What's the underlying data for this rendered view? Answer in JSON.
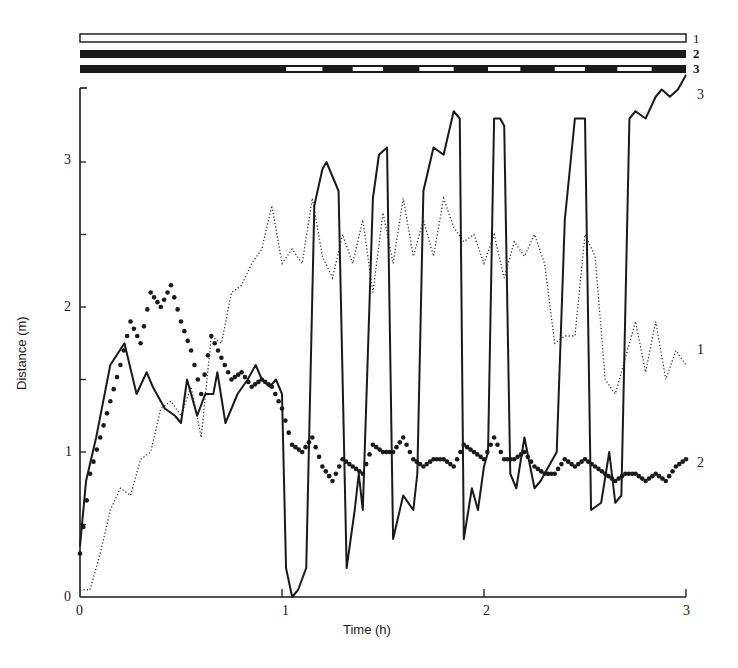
{
  "chart_data": {
    "type": "line",
    "title": "",
    "xlabel": "Time (h)",
    "ylabel": "Distance (m)",
    "xlim": [
      0,
      3
    ],
    "ylim": [
      0,
      3.5
    ],
    "x_ticks": [
      "0",
      "1",
      "2",
      "3"
    ],
    "y_ticks": [
      "0",
      "1",
      "2",
      "3"
    ],
    "grid": false,
    "legend_position": "inline labels at right end of each series",
    "condition_bars": [
      {
        "label": "1",
        "style": "open (white) bar for full duration"
      },
      {
        "label": "2",
        "style": "solid (black) bar for full duration"
      },
      {
        "label": "3",
        "style": "black bar, alternating with white gaps after ~1 h",
        "white_segments_h": [
          [
            1.02,
            1.2
          ],
          [
            1.35,
            1.5
          ],
          [
            1.68,
            1.85
          ],
          [
            2.02,
            2.18
          ],
          [
            2.35,
            2.5
          ],
          [
            2.66,
            2.83
          ]
        ]
      }
    ],
    "series": [
      {
        "name": "1",
        "style": "dotted line",
        "x": [
          0,
          0.05,
          0.1,
          0.15,
          0.2,
          0.25,
          0.3,
          0.35,
          0.4,
          0.45,
          0.5,
          0.55,
          0.6,
          0.65,
          0.7,
          0.75,
          0.8,
          0.85,
          0.9,
          0.95,
          1.0,
          1.05,
          1.1,
          1.15,
          1.2,
          1.25,
          1.3,
          1.35,
          1.4,
          1.45,
          1.5,
          1.55,
          1.6,
          1.65,
          1.7,
          1.75,
          1.8,
          1.85,
          1.9,
          1.95,
          2.0,
          2.05,
          2.1,
          2.15,
          2.2,
          2.25,
          2.3,
          2.35,
          2.4,
          2.45,
          2.5,
          2.55,
          2.6,
          2.65,
          2.7,
          2.75,
          2.8,
          2.85,
          2.9,
          2.95,
          3.0
        ],
        "y": [
          0.05,
          0.05,
          0.3,
          0.6,
          0.75,
          0.7,
          0.95,
          1.0,
          1.3,
          1.35,
          1.25,
          1.45,
          1.1,
          1.8,
          1.75,
          2.1,
          2.15,
          2.3,
          2.4,
          2.7,
          2.3,
          2.4,
          2.3,
          2.75,
          2.35,
          2.2,
          2.5,
          2.3,
          2.6,
          2.1,
          2.65,
          2.3,
          2.75,
          2.35,
          2.6,
          2.35,
          2.75,
          2.55,
          2.45,
          2.5,
          2.3,
          2.5,
          2.2,
          2.45,
          2.35,
          2.5,
          2.3,
          1.75,
          1.8,
          1.8,
          2.5,
          2.35,
          1.5,
          1.4,
          1.65,
          1.9,
          1.55,
          1.9,
          1.5,
          1.7,
          1.6
        ]
      },
      {
        "name": "2",
        "style": "large dots",
        "x": [
          0,
          0.05,
          0.1,
          0.15,
          0.2,
          0.25,
          0.3,
          0.35,
          0.4,
          0.45,
          0.5,
          0.55,
          0.6,
          0.65,
          0.7,
          0.75,
          0.8,
          0.85,
          0.9,
          0.95,
          1.0,
          1.05,
          1.1,
          1.15,
          1.2,
          1.25,
          1.3,
          1.35,
          1.4,
          1.45,
          1.5,
          1.55,
          1.6,
          1.65,
          1.7,
          1.75,
          1.8,
          1.85,
          1.9,
          1.95,
          2.0,
          2.05,
          2.1,
          2.15,
          2.2,
          2.25,
          2.3,
          2.35,
          2.4,
          2.45,
          2.5,
          2.55,
          2.6,
          2.65,
          2.7,
          2.75,
          2.8,
          2.85,
          2.9,
          2.95,
          3.0
        ],
        "y": [
          0.3,
          0.85,
          1.1,
          1.35,
          1.6,
          1.9,
          1.75,
          2.1,
          2.0,
          2.15,
          1.9,
          1.7,
          1.4,
          1.8,
          1.65,
          1.5,
          1.55,
          1.45,
          1.5,
          1.45,
          1.3,
          1.05,
          1.0,
          1.1,
          0.9,
          0.8,
          0.95,
          0.9,
          0.85,
          1.05,
          1.0,
          1.0,
          1.1,
          0.95,
          0.9,
          0.95,
          0.95,
          0.9,
          1.05,
          1.0,
          0.95,
          1.1,
          0.95,
          0.95,
          1.0,
          0.9,
          0.85,
          0.85,
          0.95,
          0.9,
          0.95,
          0.9,
          0.85,
          0.8,
          0.85,
          0.85,
          0.8,
          0.85,
          0.8,
          0.9,
          0.95
        ]
      },
      {
        "name": "3",
        "style": "solid line",
        "x": [
          0,
          0.03,
          0.08,
          0.15,
          0.22,
          0.28,
          0.33,
          0.36,
          0.42,
          0.47,
          0.5,
          0.53,
          0.58,
          0.62,
          0.66,
          0.68,
          0.72,
          0.78,
          0.83,
          0.87,
          0.9,
          0.94,
          0.97,
          1.0,
          1.02,
          1.05,
          1.08,
          1.12,
          1.16,
          1.2,
          1.22,
          1.28,
          1.32,
          1.36,
          1.38,
          1.4,
          1.45,
          1.48,
          1.52,
          1.55,
          1.6,
          1.65,
          1.67,
          1.7,
          1.75,
          1.8,
          1.85,
          1.88,
          1.9,
          1.94,
          1.97,
          2.0,
          2.02,
          2.05,
          2.08,
          2.1,
          2.13,
          2.16,
          2.2,
          2.25,
          2.28,
          2.32,
          2.36,
          2.4,
          2.45,
          2.5,
          2.53,
          2.58,
          2.62,
          2.65,
          2.68,
          2.72,
          2.75,
          2.8,
          2.85,
          2.88,
          2.92,
          2.96,
          3.0
        ],
        "y": [
          0.35,
          0.8,
          1.1,
          1.6,
          1.75,
          1.4,
          1.55,
          1.45,
          1.3,
          1.25,
          1.2,
          1.5,
          1.25,
          1.4,
          1.4,
          1.55,
          1.2,
          1.4,
          1.5,
          1.6,
          1.5,
          1.45,
          1.5,
          1.4,
          0.2,
          0.0,
          0.05,
          0.2,
          2.7,
          2.95,
          3.0,
          2.8,
          0.2,
          0.6,
          0.85,
          0.6,
          2.75,
          3.05,
          3.1,
          0.4,
          0.7,
          0.6,
          0.85,
          2.8,
          3.1,
          3.05,
          3.35,
          3.3,
          0.4,
          0.75,
          0.6,
          0.9,
          1.0,
          3.3,
          3.3,
          3.25,
          0.85,
          0.75,
          1.1,
          0.75,
          0.8,
          0.9,
          1.0,
          2.6,
          3.3,
          3.3,
          0.6,
          0.65,
          1.0,
          0.65,
          0.7,
          3.3,
          3.35,
          3.3,
          3.45,
          3.5,
          3.45,
          3.5,
          3.6
        ]
      }
    ],
    "series_end_labels": [
      "1",
      "2",
      "3"
    ]
  },
  "labels": {
    "xlabel": "Time (h)",
    "ylabel": "Distance (m)",
    "bar_labels": [
      "1",
      "2",
      "3"
    ],
    "series_end_labels": {
      "s1": "1",
      "s2": "2",
      "s3": "3"
    },
    "x_ticks": [
      "0",
      "1",
      "2",
      "3"
    ],
    "y_ticks": [
      "0",
      "1",
      "2",
      "3"
    ]
  }
}
